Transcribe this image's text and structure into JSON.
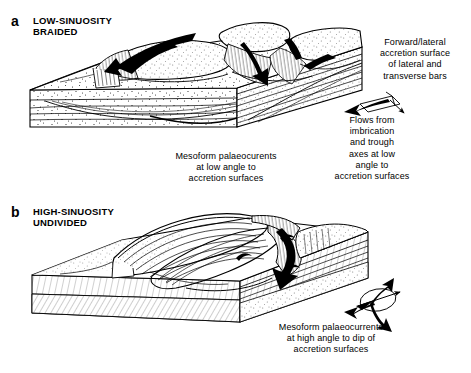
{
  "figure": {
    "background_color": "#ffffff",
    "line_color": "#000000",
    "width": 471,
    "height": 373
  },
  "panels": [
    {
      "letter": "a",
      "title": "LOW-SINUOSITY\nBRAIDED",
      "diagram_name": "low-sinuosity-braided-block-diagram"
    },
    {
      "letter": "b",
      "title": "HIGH-SINUOSITY\nUNDIVIDED",
      "diagram_name": "high-sinuosity-undivided-block-diagram"
    }
  ],
  "captions": {
    "accretion_surface": "Forward/lateral\naccretion surface\nof lateral and\ntransverse bars",
    "flows_from": "Flows from\nimbrication\nand trough\naxes at low\nangle to\naccretion surfaces",
    "mesoform_low_angle": "Mesoform palaeocurents\nat low angle to\naccretion surfaces",
    "mesoform_high_angle": "Mesoform palaeocurrents\nat high angle to dip of\naccretion surfaces"
  },
  "symbols": {
    "rose_top": "palaeocurrent-rose-low-angle",
    "rose_bottom": "palaeocurrent-rose-high-angle"
  }
}
